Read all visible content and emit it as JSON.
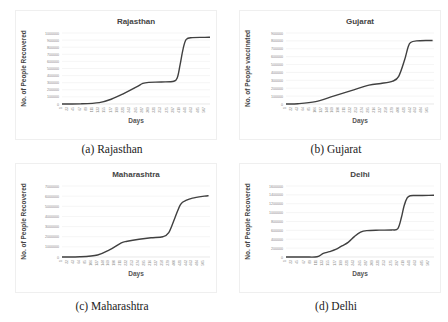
{
  "figure": {
    "panels": [
      {
        "id": "a",
        "caption": "(a) Rajasthan",
        "title": "Rajasthan",
        "ylabel": "No. of People Recovered",
        "xlabel": "Days"
      },
      {
        "id": "b",
        "caption": "(b) Gujarat",
        "title": "Gujarat",
        "ylabel": "No. of People vaccinated",
        "xlabel": "Days"
      },
      {
        "id": "c",
        "caption": "(c) Maharashtra",
        "title": "Maharashtra",
        "ylabel": "No. of People Recovered",
        "xlabel": "Days"
      },
      {
        "id": "d",
        "caption": "(d) Delhi",
        "title": "Delhi",
        "ylabel": "No. of People Recovered",
        "xlabel": "Days"
      }
    ]
  },
  "chart_data": [
    {
      "type": "line",
      "title": "Rajasthan",
      "xlabel": "Days",
      "ylabel": "No. of People Recovered",
      "ylim": [
        0,
        1000000
      ],
      "yticks": [
        0,
        100000,
        200000,
        300000,
        400000,
        500000,
        600000,
        700000,
        800000,
        900000,
        1000000
      ],
      "xticks": [
        1,
        23,
        45,
        67,
        89,
        111,
        133,
        155,
        177,
        199,
        221,
        243,
        265,
        287,
        309,
        331,
        353,
        375,
        397,
        419,
        441,
        463,
        485,
        507
      ],
      "grid": true,
      "x": [
        1,
        67,
        133,
        177,
        221,
        265,
        287,
        309,
        353,
        397,
        410,
        419,
        430,
        441,
        463,
        507,
        525
      ],
      "values": [
        0,
        2000,
        20000,
        70000,
        150000,
        240000,
        290000,
        305000,
        310000,
        320000,
        380000,
        550000,
        780000,
        910000,
        935000,
        938000,
        940000
      ]
    },
    {
      "type": "line",
      "title": "Gujarat",
      "xlabel": "Days",
      "ylabel": "No. of People vaccinated",
      "ylim": [
        0,
        900000
      ],
      "yticks": [
        0,
        100000,
        200000,
        300000,
        400000,
        500000,
        600000,
        700000,
        800000,
        900000
      ],
      "xticks": [
        1,
        22,
        43,
        64,
        85,
        106,
        127,
        148,
        169,
        190,
        211,
        232,
        253,
        274,
        295,
        316,
        337,
        358,
        379,
        400,
        421,
        442,
        463,
        484,
        505
      ],
      "grid": true,
      "x": [
        1,
        43,
        106,
        169,
        232,
        295,
        337,
        379,
        400,
        421,
        433,
        442,
        463,
        505,
        520
      ],
      "values": [
        0,
        3000,
        30000,
        100000,
        170000,
        240000,
        260000,
        290000,
        350000,
        560000,
        720000,
        780000,
        800000,
        805000,
        805000
      ]
    },
    {
      "type": "line",
      "title": "Maharashtra",
      "xlabel": "Days",
      "ylabel": "No. of People Recovered",
      "ylim": [
        0,
        7000000
      ],
      "yticks": [
        0,
        1000000,
        2000000,
        3000000,
        4000000,
        5000000,
        6000000,
        7000000
      ],
      "xticks": [
        1,
        22,
        43,
        64,
        85,
        106,
        127,
        148,
        169,
        190,
        211,
        232,
        253,
        274,
        295,
        316,
        337,
        358,
        379,
        400,
        421,
        442,
        463,
        484,
        505
      ],
      "grid": true,
      "x": [
        1,
        64,
        127,
        169,
        211,
        232,
        274,
        316,
        358,
        379,
        400,
        421,
        442,
        463,
        505,
        520
      ],
      "values": [
        0,
        20000,
        200000,
        700000,
        1400000,
        1550000,
        1750000,
        1900000,
        2000000,
        2400000,
        3800000,
        5200000,
        5600000,
        5800000,
        6000000,
        6050000
      ]
    },
    {
      "type": "line",
      "title": "Delhi",
      "xlabel": "Days",
      "ylabel": "No. of People Recovered",
      "ylim": [
        0,
        1600000
      ],
      "yticks": [
        0,
        200000,
        400000,
        600000,
        800000,
        1000000,
        1200000,
        1400000,
        1600000
      ],
      "xticks": [
        1,
        23,
        45,
        67,
        89,
        111,
        133,
        155,
        177,
        199,
        221,
        243,
        265,
        287,
        309,
        331,
        353,
        375,
        397,
        419,
        441,
        463,
        485,
        507
      ],
      "grid": true,
      "x": [
        1,
        67,
        111,
        133,
        155,
        177,
        199,
        221,
        243,
        265,
        287,
        331,
        375,
        397,
        410,
        419,
        430,
        441,
        463,
        507,
        525
      ],
      "values": [
        0,
        0,
        5000,
        80000,
        120000,
        170000,
        250000,
        330000,
        460000,
        560000,
        595000,
        605000,
        610000,
        640000,
        900000,
        1150000,
        1330000,
        1380000,
        1385000,
        1388000,
        1390000
      ]
    }
  ]
}
